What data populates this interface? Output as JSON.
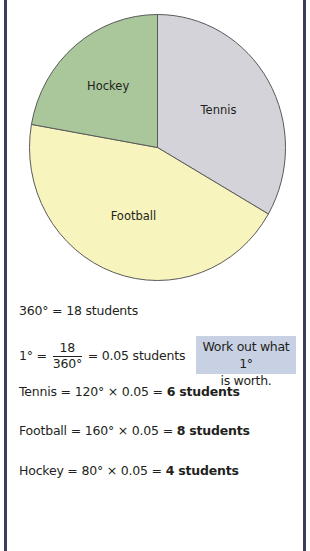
{
  "chart_data": {
    "type": "pie",
    "title": "",
    "start_angle_deg": 0,
    "direction": "clockwise",
    "slices": [
      {
        "label": "Tennis",
        "angle_deg": 120,
        "students": 6,
        "color": "#d3d3d9"
      },
      {
        "label": "Football",
        "angle_deg": 160,
        "students": 8,
        "color": "#f8f4bd"
      },
      {
        "label": "Hockey",
        "angle_deg": 80,
        "students": 4,
        "color": "#a9c79a"
      }
    ],
    "edge_color": "#5a5a5a"
  },
  "working": {
    "total_line": "360° = 18 students",
    "one_degree": {
      "lhs": "1° =",
      "numerator": "18",
      "denominator": "360°",
      "rhs": "= 0.05 students"
    },
    "callout": {
      "line1": "Work out what 1°",
      "line2": "is worth.",
      "color": "#c8d1e3"
    },
    "results": [
      {
        "expr": "Tennis = 120° × 0.05 = ",
        "answer": "6 students"
      },
      {
        "expr": "Football = 160° × 0.05 = ",
        "answer": "8 students"
      },
      {
        "expr": "Hockey = 80° × 0.05 = ",
        "answer": "4 students"
      }
    ]
  },
  "colors": {
    "frame": "#3a3d5c",
    "text": "#231f20"
  }
}
